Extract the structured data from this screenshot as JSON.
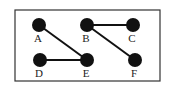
{
  "diagram": {
    "type": "graph",
    "frame": {
      "x": 15,
      "y": 10,
      "width": 145,
      "height": 71,
      "stroke": "#333333"
    },
    "node_color": "#111111",
    "edge_color": "#111111",
    "nodes": [
      {
        "id": "A",
        "label": "A",
        "x": 39,
        "y": 25
      },
      {
        "id": "B",
        "label": "B",
        "x": 87,
        "y": 25
      },
      {
        "id": "C",
        "label": "C",
        "x": 133,
        "y": 25
      },
      {
        "id": "D",
        "label": "D",
        "x": 40,
        "y": 60
      },
      {
        "id": "E",
        "label": "E",
        "x": 87,
        "y": 60
      },
      {
        "id": "F",
        "label": "F",
        "x": 135,
        "y": 60
      }
    ],
    "edges": [
      {
        "from": "A",
        "to": "E"
      },
      {
        "from": "D",
        "to": "E"
      },
      {
        "from": "B",
        "to": "C"
      },
      {
        "from": "B",
        "to": "F"
      }
    ]
  }
}
